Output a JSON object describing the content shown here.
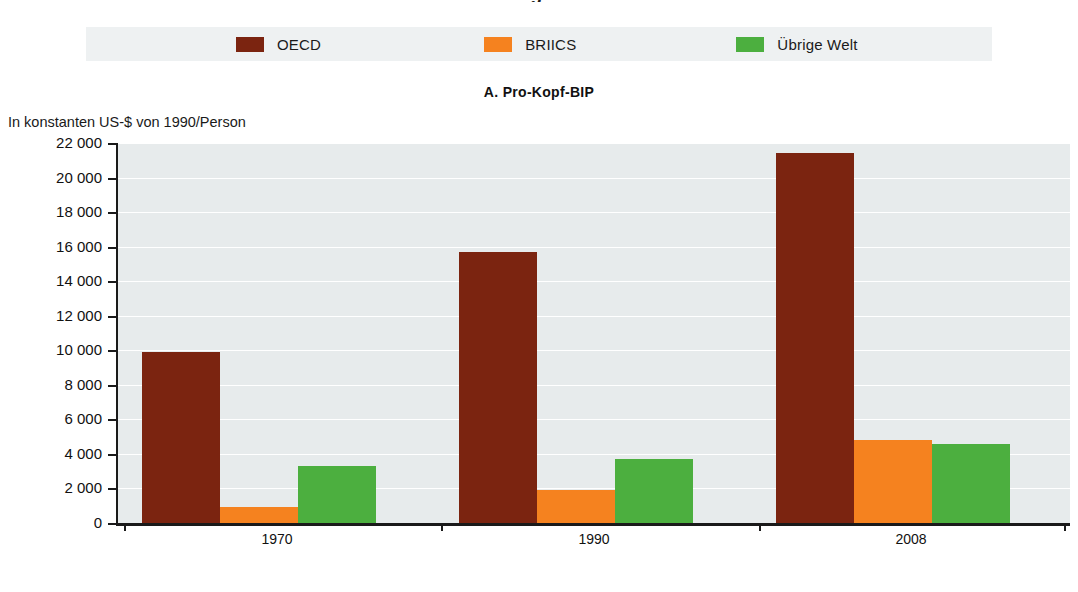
{
  "header": {
    "clipped_glyph": "g."
  },
  "legend": {
    "items": [
      {
        "label": "OECD",
        "color": "#7B2410"
      },
      {
        "label": "BRIICS",
        "color": "#F5821F"
      },
      {
        "label": "Übrige Welt",
        "color": "#4CAF3F"
      }
    ],
    "background": "#eef1f2"
  },
  "panel": {
    "title": "A. Pro-Kopf-BIP",
    "unit_label": "In konstanten US-$ von 1990/Person"
  },
  "chart_data": {
    "type": "bar",
    "title": "A. Pro-Kopf-BIP",
    "subtitle": "In konstanten US-$ von 1990/Person",
    "xlabel": "",
    "ylabel": "In konstanten US-$ von 1990/Person",
    "categories": [
      "1970",
      "1990",
      "2008"
    ],
    "series": [
      {
        "name": "OECD",
        "color": "#7B2410",
        "values": [
          9900,
          15700,
          21400
        ]
      },
      {
        "name": "BRIICS",
        "color": "#F5821F",
        "values": [
          950,
          1900,
          4800
        ]
      },
      {
        "name": "Übrige Welt",
        "color": "#4CAF3F",
        "values": [
          3300,
          3700,
          4550
        ]
      }
    ],
    "ylim": [
      0,
      22000
    ],
    "ytick_values": [
      0,
      2000,
      4000,
      6000,
      8000,
      10000,
      12000,
      14000,
      16000,
      18000,
      20000,
      22000
    ],
    "ytick_labels": [
      "0",
      "2 000",
      "4 000",
      "6 000",
      "8 000",
      "10 000",
      "12 000",
      "14 000",
      "16 000",
      "18 000",
      "20 000",
      "22 000"
    ],
    "grid": true,
    "grid_orientation": "horizontal",
    "legend_position": "top",
    "plot_background": "#e7ebec"
  }
}
